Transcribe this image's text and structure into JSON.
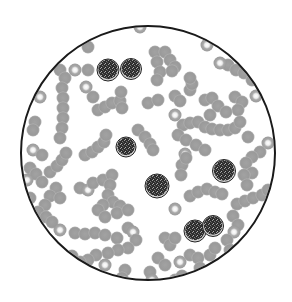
{
  "diagram": {
    "type": "blood-smear-microscope-field",
    "field": {
      "cx": 148,
      "cy": 153,
      "r": 127,
      "border_color": "#1a1a1a",
      "border_width": 2
    },
    "colors": {
      "background": "#ffffff",
      "rbc_fill": "#9c9c9c",
      "rbc_highlight": "#f2f2f2",
      "wbc_fill": "#3a3a3a",
      "wbc_speckle": "#8a8a8a",
      "wbc_rim": "#d8d8d8"
    },
    "white_blood_cells": [
      {
        "x": 108,
        "y": 70,
        "r": 11
      },
      {
        "x": 131,
        "y": 69,
        "r": 10.5
      },
      {
        "x": 126,
        "y": 147,
        "r": 10
      },
      {
        "x": 157,
        "y": 186,
        "r": 12
      },
      {
        "x": 224,
        "y": 171,
        "r": 11.5
      },
      {
        "x": 195,
        "y": 231,
        "r": 11
      },
      {
        "x": 213,
        "y": 226,
        "r": 10.5
      }
    ],
    "red_blood_cells": [
      [
        140,
        27,
        1
      ],
      [
        88,
        47
      ],
      [
        155,
        52
      ],
      [
        165,
        52
      ],
      [
        170,
        60
      ],
      [
        175,
        67
      ],
      [
        157,
        62
      ],
      [
        160,
        72
      ],
      [
        157,
        80
      ],
      [
        172,
        71
      ],
      [
        207,
        45,
        1
      ],
      [
        228,
        65
      ],
      [
        236,
        70
      ],
      [
        244,
        73
      ],
      [
        252,
        80
      ],
      [
        220,
        63,
        1
      ],
      [
        60,
        70
      ],
      [
        65,
        78
      ],
      [
        75,
        70,
        1
      ],
      [
        88,
        70
      ],
      [
        62,
        88
      ],
      [
        63,
        98
      ],
      [
        63,
        108
      ],
      [
        63,
        118
      ],
      [
        62,
        128
      ],
      [
        60,
        138
      ],
      [
        40,
        97,
        1
      ],
      [
        35,
        122
      ],
      [
        33,
        130
      ],
      [
        86,
        87,
        1
      ],
      [
        93,
        97
      ],
      [
        98,
        110
      ],
      [
        105,
        107
      ],
      [
        112,
        103
      ],
      [
        120,
        101
      ],
      [
        121,
        92
      ],
      [
        122,
        108
      ],
      [
        148,
        103
      ],
      [
        158,
        100
      ],
      [
        175,
        96
      ],
      [
        180,
        101
      ],
      [
        175,
        115,
        1
      ],
      [
        190,
        90
      ],
      [
        192,
        84
      ],
      [
        190,
        78
      ],
      [
        205,
        100
      ],
      [
        212,
        98
      ],
      [
        218,
        106
      ],
      [
        210,
        115
      ],
      [
        235,
        97
      ],
      [
        242,
        102
      ],
      [
        238,
        110
      ],
      [
        256,
        96,
        1
      ],
      [
        183,
        125
      ],
      [
        190,
        123
      ],
      [
        198,
        122
      ],
      [
        205,
        127
      ],
      [
        212,
        129
      ],
      [
        220,
        130
      ],
      [
        228,
        130
      ],
      [
        235,
        128
      ],
      [
        240,
        122
      ],
      [
        248,
        137
      ],
      [
        226,
        112
      ],
      [
        138,
        130
      ],
      [
        145,
        137
      ],
      [
        150,
        144
      ],
      [
        153,
        150
      ],
      [
        178,
        135
      ],
      [
        186,
        140
      ],
      [
        196,
        145
      ],
      [
        205,
        150
      ],
      [
        185,
        154,
        1
      ],
      [
        182,
        165
      ],
      [
        181,
        175
      ],
      [
        186,
        158
      ],
      [
        268,
        143,
        1
      ],
      [
        260,
        152
      ],
      [
        252,
        157
      ],
      [
        246,
        163
      ],
      [
        252,
        173
      ],
      [
        244,
        175
      ],
      [
        247,
        185
      ],
      [
        33,
        150,
        1
      ],
      [
        42,
        155
      ],
      [
        30,
        168
      ],
      [
        36,
        174
      ],
      [
        42,
        182
      ],
      [
        50,
        172
      ],
      [
        57,
        166
      ],
      [
        62,
        160
      ],
      [
        66,
        153
      ],
      [
        56,
        188
      ],
      [
        50,
        196
      ],
      [
        45,
        205
      ],
      [
        38,
        212
      ],
      [
        46,
        217
      ],
      [
        52,
        222
      ],
      [
        60,
        198
      ],
      [
        85,
        155
      ],
      [
        92,
        152
      ],
      [
        98,
        147
      ],
      [
        104,
        142
      ],
      [
        106,
        135
      ],
      [
        80,
        188
      ],
      [
        88,
        190,
        1
      ],
      [
        93,
        183
      ],
      [
        103,
        180
      ],
      [
        112,
        175
      ],
      [
        110,
        185
      ],
      [
        108,
        195
      ],
      [
        113,
        202
      ],
      [
        120,
        206
      ],
      [
        117,
        213
      ],
      [
        103,
        205
      ],
      [
        98,
        210
      ],
      [
        105,
        217
      ],
      [
        128,
        210
      ],
      [
        27,
        180,
        1
      ],
      [
        30,
        198
      ],
      [
        175,
        209,
        1
      ],
      [
        190,
        196
      ],
      [
        198,
        192
      ],
      [
        207,
        189
      ],
      [
        215,
        192
      ],
      [
        222,
        194
      ],
      [
        237,
        204
      ],
      [
        245,
        201
      ],
      [
        253,
        198
      ],
      [
        262,
        195
      ],
      [
        268,
        190
      ],
      [
        233,
        216
      ],
      [
        238,
        225
      ],
      [
        234,
        232,
        1
      ],
      [
        60,
        230,
        1
      ],
      [
        75,
        233
      ],
      [
        85,
        234
      ],
      [
        95,
        233
      ],
      [
        105,
        235
      ],
      [
        117,
        238
      ],
      [
        128,
        228
      ],
      [
        133,
        232,
        1
      ],
      [
        136,
        240
      ],
      [
        128,
        248
      ],
      [
        118,
        250
      ],
      [
        108,
        253
      ],
      [
        96,
        255
      ],
      [
        88,
        260
      ],
      [
        80,
        262
      ],
      [
        72,
        256
      ],
      [
        63,
        258
      ],
      [
        105,
        265,
        1
      ],
      [
        165,
        238
      ],
      [
        170,
        245
      ],
      [
        175,
        238
      ],
      [
        158,
        258
      ],
      [
        165,
        265
      ],
      [
        180,
        262,
        1
      ],
      [
        190,
        255
      ],
      [
        198,
        258
      ],
      [
        210,
        255
      ],
      [
        215,
        248
      ],
      [
        227,
        240
      ],
      [
        230,
        250
      ],
      [
        125,
        270
      ],
      [
        122,
        278
      ],
      [
        150,
        272
      ],
      [
        152,
        280,
        1
      ],
      [
        175,
        280
      ],
      [
        182,
        276
      ],
      [
        200,
        268
      ],
      [
        208,
        275
      ],
      [
        220,
        265
      ]
    ]
  }
}
